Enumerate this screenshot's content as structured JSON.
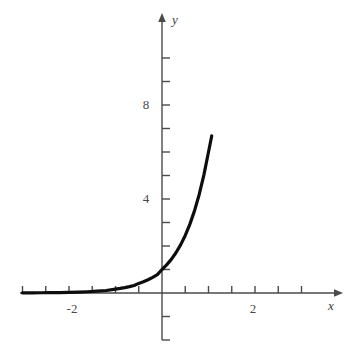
{
  "figure": {
    "background_color": "#ffffff",
    "curve_color": "#0d0d0d",
    "axis_color": "#4a4a4a",
    "text_color": "#3f3f3f"
  },
  "axes": {
    "x_axis_label": "x",
    "y_axis_label": "y",
    "x_tick_labels": [
      {
        "text": "-2",
        "value": -2
      },
      {
        "text": "2",
        "value": 2
      }
    ],
    "y_tick_labels": [
      {
        "text": "4",
        "value": 4
      },
      {
        "text": "8",
        "value": 8
      }
    ],
    "x_minor_ticks": [
      -3.0,
      -2.5,
      -2.0,
      -1.5,
      -1.0,
      -0.5,
      0.5,
      1.0,
      1.5,
      2.0,
      2.5,
      3.0
    ],
    "y_minor_ticks": [
      -2.0,
      -1.0,
      1.0,
      2.0,
      3.0,
      4.0,
      5.0,
      6.0,
      7.0,
      8.0,
      9.0,
      10.0
    ],
    "x_arrow_at": 3.8,
    "y_arrow_at": 11.8
  },
  "chart_data": {
    "type": "line",
    "title": "",
    "xlabel": "x",
    "ylabel": "y",
    "xlim": [
      -3.05,
      3.8
    ],
    "ylim": [
      -2.9,
      11.8
    ],
    "grid": false,
    "legend": null,
    "series": [
      {
        "name": "exponential-curve",
        "function": "y = 6^x",
        "color": "#0d0d0d",
        "line_width": 3.2,
        "x": [
          -3.0,
          -2.8,
          -2.6,
          -2.4,
          -2.2,
          -2.0,
          -1.8,
          -1.6,
          -1.4,
          -1.2,
          -1.0,
          -0.9,
          -0.8,
          -0.7,
          -0.6,
          -0.5,
          -0.4,
          -0.3,
          -0.2,
          -0.1,
          0.0,
          0.1,
          0.2,
          0.3,
          0.4,
          0.5,
          0.6,
          0.7,
          0.8,
          0.9,
          1.0,
          1.07
        ],
        "y": [
          0.005,
          0.007,
          0.01,
          0.014,
          0.02,
          0.028,
          0.039,
          0.054,
          0.076,
          0.106,
          0.167,
          0.196,
          0.231,
          0.272,
          0.32,
          0.408,
          0.48,
          0.565,
          0.665,
          0.783,
          1.0,
          1.196,
          1.431,
          1.712,
          2.048,
          2.449,
          2.93,
          3.505,
          4.193,
          5.016,
          6.0,
          6.69
        ],
        "pixel_top_end": {
          "x": 212,
          "y": 50
        },
        "pixel_start": {
          "x": 22,
          "y": 293
        }
      }
    ],
    "annotations": []
  }
}
